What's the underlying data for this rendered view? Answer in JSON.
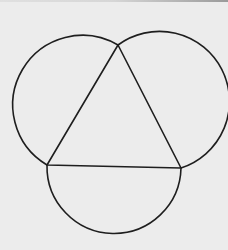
{
  "diagram": {
    "colors": {
      "background": "#ececec",
      "stroke": "#1e1e1e"
    },
    "stroke_width": 1.6,
    "triangle": {
      "vertices": [
        {
          "name": "top",
          "x": 118,
          "y": 45
        },
        {
          "name": "bottom-left",
          "x": 47,
          "y": 165
        },
        {
          "name": "bottom-right",
          "x": 181,
          "y": 168
        }
      ]
    },
    "arcs": [
      {
        "name": "left-arc",
        "from": [
          118,
          45
        ],
        "to": [
          47,
          165
        ],
        "r": 69,
        "large": 1,
        "sweep": 0
      },
      {
        "name": "right-arc",
        "from": [
          118,
          45
        ],
        "to": [
          181,
          168
        ],
        "r": 70,
        "large": 1,
        "sweep": 1
      },
      {
        "name": "bottom-arc",
        "from": [
          47,
          165
        ],
        "to": [
          181,
          168
        ],
        "r": 67,
        "large": 0,
        "sweep": 0
      }
    ]
  }
}
